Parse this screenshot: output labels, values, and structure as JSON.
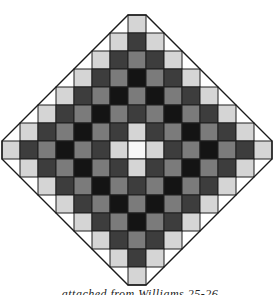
{
  "figure": {
    "type": "diamond-grid-pattern",
    "rows": 15,
    "cell_size": 18,
    "center_x": 137,
    "top_y": 15,
    "palette": {
      "W": "#f7f7f7",
      "L": "#d5d5d5",
      "M": "#7b7b7b",
      "D": "#3d3d3d",
      "K": "#141414"
    },
    "grid_line_color": "#1f1f1f",
    "frame_color": "#1a1a1a",
    "grid": [
      [
        "L"
      ],
      [
        "L",
        "D",
        "L"
      ],
      [
        "L",
        "D",
        "M",
        "D",
        "L"
      ],
      [
        "L",
        "D",
        "M",
        "K",
        "M",
        "D",
        "L"
      ],
      [
        "L",
        "D",
        "M",
        "K",
        "M",
        "K",
        "M",
        "D",
        "L"
      ],
      [
        "L",
        "D",
        "M",
        "K",
        "M",
        "D",
        "M",
        "K",
        "M",
        "D",
        "L"
      ],
      [
        "L",
        "D",
        "M",
        "K",
        "M",
        "D",
        "L",
        "D",
        "M",
        "K",
        "M",
        "D",
        "L"
      ],
      [
        "L",
        "D",
        "M",
        "K",
        "M",
        "D",
        "L",
        "W",
        "L",
        "D",
        "M",
        "K",
        "M",
        "D",
        "L"
      ],
      [
        "L",
        "D",
        "M",
        "K",
        "M",
        "D",
        "L",
        "D",
        "M",
        "K",
        "M",
        "D",
        "L"
      ],
      [
        "L",
        "D",
        "M",
        "K",
        "M",
        "D",
        "M",
        "K",
        "M",
        "D",
        "L"
      ],
      [
        "L",
        "D",
        "M",
        "K",
        "M",
        "K",
        "M",
        "D",
        "L"
      ],
      [
        "L",
        "D",
        "M",
        "K",
        "M",
        "D",
        "L"
      ],
      [
        "L",
        "D",
        "M",
        "D",
        "L"
      ],
      [
        "L",
        "D",
        "L"
      ],
      [
        "L"
      ]
    ]
  },
  "caption": {
    "text": "attached from Williams 25-26",
    "note_visible": "partially clipped at bottom edge"
  }
}
